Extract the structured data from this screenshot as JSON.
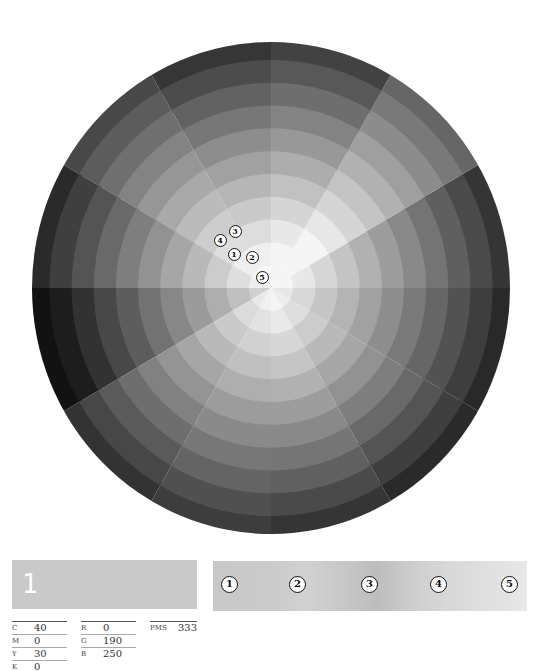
{
  "wheel": {
    "center": [
      271,
      288
    ],
    "radius_x": 239,
    "radius_y": 246,
    "rings": 11,
    "sector_degrees": 30,
    "sectors_base_brightness": [
      205,
      232,
      222,
      212,
      210,
      196,
      170,
      192,
      198,
      206,
      196,
      190
    ],
    "sector_extent": [
      1.0,
      1.25,
      1.05,
      1.0,
      1.1,
      0.95,
      0.8,
      1.0,
      1.05,
      1.0,
      0.95,
      0.95
    ],
    "markers": [
      {
        "label": "1",
        "x": 234,
        "y": 254
      },
      {
        "label": "2",
        "x": 252,
        "y": 257
      },
      {
        "label": "3",
        "x": 235,
        "y": 231
      },
      {
        "label": "4",
        "x": 220,
        "y": 240
      },
      {
        "label": "5",
        "x": 262,
        "y": 277
      }
    ]
  },
  "swatch": {
    "number": "1",
    "color": "#c9c9c9"
  },
  "cmyk": [
    {
      "key": "C",
      "value": "40"
    },
    {
      "key": "M",
      "value": "0"
    },
    {
      "key": "Y",
      "value": "30"
    },
    {
      "key": "K",
      "value": "0"
    }
  ],
  "rgb": [
    {
      "key": "R",
      "value": "0"
    },
    {
      "key": "G",
      "value": "190"
    },
    {
      "key": "B",
      "value": "250"
    }
  ],
  "pms": {
    "key": "PMS",
    "value": "333"
  },
  "gradient_bar": {
    "markers": [
      {
        "label": "1",
        "x": 8
      },
      {
        "label": "2",
        "x": 76
      },
      {
        "label": "3",
        "x": 148
      },
      {
        "label": "4",
        "x": 217
      },
      {
        "label": "5",
        "x": 288
      }
    ]
  }
}
